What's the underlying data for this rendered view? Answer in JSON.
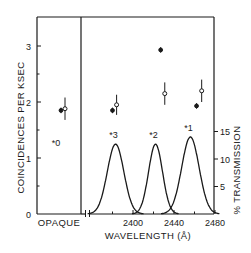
{
  "chart_data": {
    "type": "scatter",
    "title": "",
    "left_axis": {
      "label": "COINCIDENCES PER KSEC",
      "ticks": [
        "0",
        "1",
        "2",
        "3"
      ],
      "ylim": [
        0,
        3.5
      ]
    },
    "right_axis": {
      "label": "% TRANSMISSION",
      "ticks": [
        "5",
        "10",
        "15"
      ],
      "ylim": [
        0,
        25
      ]
    },
    "x_axis": {
      "label": "WAVELENGTH (Å)",
      "ticks": [
        "2400",
        "2440",
        "2480"
      ],
      "xlim": [
        2355,
        2480
      ],
      "break": true
    },
    "opaque_panel": {
      "label": "OPAQUE",
      "filter_label": "#0"
    },
    "series": [
      {
        "name": "filled points",
        "marker": "filled-circle",
        "points": [
          {
            "filter": "#0",
            "x": "OPAQUE",
            "y": 1.85,
            "err": 0.05
          },
          {
            "filter": "#3",
            "x": 2380,
            "y": 1.85,
            "err": 0.05
          },
          {
            "filter": "#2",
            "x": 2427,
            "y": 2.93,
            "err": 0.05
          },
          {
            "filter": "#1",
            "x": 2462,
            "y": 1.93,
            "err": 0.05
          }
        ]
      },
      {
        "name": "open points",
        "marker": "open-circle",
        "points": [
          {
            "filter": "#0",
            "x": "OPAQUE",
            "y": 1.88,
            "err": 0.2
          },
          {
            "filter": "#3",
            "x": 2384,
            "y": 1.95,
            "err": 0.18
          },
          {
            "filter": "#2",
            "x": 2431,
            "y": 2.15,
            "err": 0.2
          },
          {
            "filter": "#1",
            "x": 2467,
            "y": 2.2,
            "err": 0.2
          }
        ]
      }
    ],
    "transmission_curves": [
      {
        "name": "#3",
        "center": 2383,
        "peak_percent": 12.7,
        "fwhm": 19
      },
      {
        "name": "#2",
        "center": 2422,
        "peak_percent": 12.7,
        "fwhm": 16
      },
      {
        "name": "#1",
        "center": 2456,
        "peak_percent": 14.0,
        "fwhm": 20
      }
    ],
    "grid": false,
    "legend": "none"
  }
}
